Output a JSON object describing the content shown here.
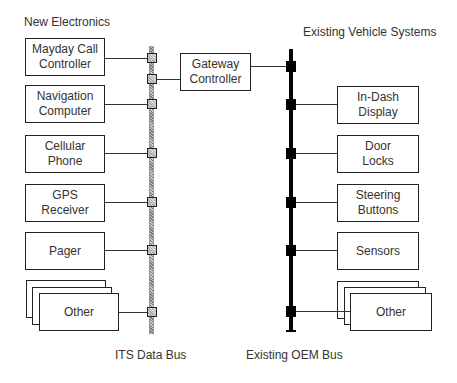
{
  "headings": {
    "new_electronics": "New Electronics",
    "existing_vehicle_systems": "Existing Vehicle Systems"
  },
  "buses": {
    "its": {
      "label": "ITS Data Bus",
      "style": "hatched-gray"
    },
    "oem": {
      "label": "Existing OEM Bus",
      "style": "solid-black"
    }
  },
  "gateway": {
    "line1": "Gateway",
    "line2": "Controller"
  },
  "left_components": [
    {
      "line1": "Mayday Call",
      "line2": "Controller"
    },
    {
      "line1": "Navigation",
      "line2": "Computer"
    },
    {
      "line1": "Cellular",
      "line2": "Phone"
    },
    {
      "line1": "GPS",
      "line2": "Receiver"
    },
    {
      "line1": "Pager",
      "line2": ""
    },
    {
      "line1": "Other",
      "line2": "",
      "stacked": true
    }
  ],
  "right_components": [
    {
      "line1": "In-Dash",
      "line2": "Display"
    },
    {
      "line1": "Door",
      "line2": "Locks"
    },
    {
      "line1": "Steering",
      "line2": "Buttons"
    },
    {
      "line1": "Sensors",
      "line2": ""
    },
    {
      "line1": "Other",
      "line2": "",
      "stacked": true
    }
  ],
  "colors": {
    "line": "#222222",
    "text": "#333333",
    "its_bus": "#999999",
    "oem_bus": "#000000"
  }
}
